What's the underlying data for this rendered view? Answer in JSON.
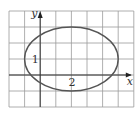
{
  "figure": {
    "type": "coordinate-plane-ellipse",
    "grid": {
      "x0": 9,
      "y0": 11,
      "cell_w": 15.6,
      "cell_h": 16,
      "cols": 8,
      "rows": 6,
      "color": "#9a9a9a"
    },
    "axes": {
      "x_label": "x",
      "y_label": "y",
      "origin_col": 2,
      "origin_row": 4,
      "color": "#333333"
    },
    "ellipse": {
      "center_units": [
        2,
        1
      ],
      "semi_axis_x_units": 3,
      "semi_axis_y_units": 2,
      "color": "#555555"
    },
    "labels": {
      "left_mark": "1",
      "bottom_mark": "2"
    }
  }
}
